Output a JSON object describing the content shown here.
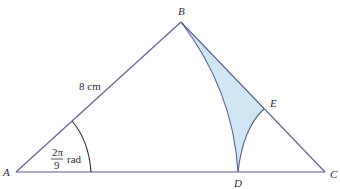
{
  "diagram": {
    "points": {
      "A": {
        "label": "A",
        "x": 16,
        "y": 172
      },
      "B": {
        "label": "B",
        "x": 181,
        "y": 22
      },
      "C": {
        "label": "C",
        "x": 325,
        "y": 172
      },
      "D": {
        "label": "D",
        "x": 238,
        "y": 172
      },
      "E": {
        "label": "E",
        "x": 264,
        "y": 109
      }
    },
    "side_label": "8 cm",
    "angle_label": {
      "numerator": "2π",
      "denominator": "9",
      "unit": "rad"
    },
    "colors": {
      "line": "#5a5f8a",
      "shade": "#cfe6f5",
      "text": "#2a2a3a"
    }
  }
}
